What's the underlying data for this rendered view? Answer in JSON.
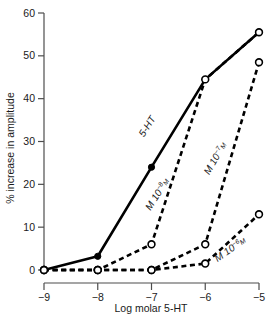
{
  "chart_data": {
    "type": "line",
    "title": "",
    "xlabel": "Log molar 5-HT",
    "ylabel": "% increase in amplitude",
    "xlim": [
      -9,
      -5
    ],
    "ylim": [
      0,
      60
    ],
    "xticks": [
      "−9",
      "−8",
      "−7",
      "−6",
      "−5"
    ],
    "xtick_values": [
      -9,
      -8,
      -7,
      -6,
      -5
    ],
    "yticks": [
      "0",
      "10",
      "20",
      "30",
      "40",
      "50",
      "60"
    ],
    "ytick_values": [
      0,
      10,
      20,
      30,
      40,
      50,
      60
    ],
    "grid": false,
    "legend": "inline-curve-labels",
    "x": [
      -9,
      -8,
      -7,
      -6,
      -5
    ],
    "series": [
      {
        "name": "5-HT",
        "label_text": "5-HT",
        "label_sup": "",
        "label_tail": "",
        "style": "solid",
        "marker": "filled-circle",
        "values": [
          0,
          3.2,
          24,
          44.5,
          55.5
        ]
      },
      {
        "name": "M 10-8 M",
        "label_text": "M 10",
        "label_sup": "−8",
        "label_tail": "M",
        "style": "dashed",
        "marker": "open-circle",
        "values": [
          0,
          0,
          6,
          44.5,
          55.5
        ]
      },
      {
        "name": "M 10-7 M",
        "label_text": "M 10",
        "label_sup": "−7",
        "label_tail": "M",
        "style": "dashed",
        "marker": "open-circle",
        "values": [
          0,
          0,
          0,
          6,
          48.5
        ]
      },
      {
        "name": "M 10-6 M",
        "label_text": "M 10",
        "label_sup": "−6",
        "label_tail": "M",
        "style": "dashed",
        "marker": "open-circle",
        "values": [
          0,
          0,
          0,
          1.5,
          13
        ]
      }
    ]
  }
}
